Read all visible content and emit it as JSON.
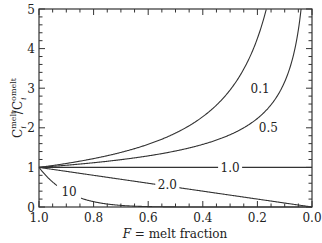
{
  "chart_data": {
    "type": "line",
    "title": "",
    "xlabel": "F = melt fraction",
    "xlabel_italic_part": "F",
    "xlabel_rest": " = melt fraction",
    "ylabel": "C_i^melt / C^o_i^melt",
    "ylabel_parts": {
      "c1": "C",
      "sub1": "i",
      "sup1": "melt",
      "slash": "/C",
      "sup0": "o",
      "sub2": "i",
      "sup2": "melt"
    },
    "xlim": [
      1.0,
      0.0
    ],
    "ylim": [
      0,
      5
    ],
    "x_reversed": true,
    "x_ticks": [
      "1.0",
      "0.8",
      "0.6",
      "0.4",
      "0.2",
      "0.0"
    ],
    "y_ticks": [
      "0",
      "1",
      "2",
      "3",
      "4",
      "5"
    ],
    "grid": false,
    "legend": "inline curve labels",
    "model": "C/C0 = F^(D-1)",
    "series": [
      {
        "name": "0.1",
        "D": 0.1,
        "x": [
          1.0,
          0.8,
          0.6,
          0.4,
          0.3,
          0.25,
          0.2,
          0.17
        ],
        "values": [
          1.0,
          1.22,
          1.58,
          2.28,
          2.95,
          3.48,
          4.26,
          4.93
        ]
      },
      {
        "name": "0.5",
        "D": 0.5,
        "x": [
          1.0,
          0.8,
          0.6,
          0.4,
          0.2,
          0.1,
          0.06,
          0.04
        ],
        "values": [
          1.0,
          1.12,
          1.29,
          1.58,
          2.24,
          3.16,
          4.08,
          5.0
        ]
      },
      {
        "name": "1.0",
        "D": 1.0,
        "x": [
          1.0,
          0.0
        ],
        "values": [
          1.0,
          1.0
        ]
      },
      {
        "name": "2.0",
        "D": 2.0,
        "x": [
          1.0,
          0.8,
          0.6,
          0.4,
          0.2,
          0.0
        ],
        "values": [
          1.0,
          0.8,
          0.6,
          0.4,
          0.2,
          0.0
        ]
      },
      {
        "name": "10",
        "D": 10,
        "x": [
          1.0,
          0.95,
          0.9,
          0.85,
          0.8,
          0.75,
          0.7,
          0.6
        ],
        "values": [
          1.0,
          0.63,
          0.39,
          0.23,
          0.13,
          0.08,
          0.04,
          0.01
        ]
      }
    ],
    "curve_labels": [
      {
        "text": "0.1",
        "x": 0.19,
        "y": 3.0
      },
      {
        "text": "0.5",
        "x": 0.16,
        "y": 2.0
      },
      {
        "text": "1.0",
        "x": 0.3,
        "y": 1.0
      },
      {
        "text": "2.0",
        "x": 0.53,
        "y": 0.58
      },
      {
        "text": "10",
        "x": 0.89,
        "y": 0.38
      }
    ]
  }
}
